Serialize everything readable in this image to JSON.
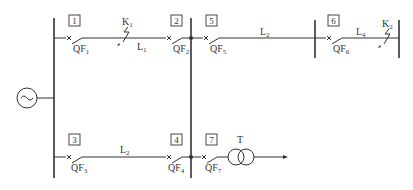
{
  "diagram": {
    "type": "power-system-one-line",
    "colors": {
      "line": "#333333",
      "background": "#ffffff"
    },
    "source": {
      "symbol": "~",
      "name": "generator-source"
    },
    "nodes": [
      {
        "id": "1",
        "breaker": "QF",
        "breaker_sub": "1"
      },
      {
        "id": "2",
        "breaker": "QF",
        "breaker_sub": "2"
      },
      {
        "id": "3",
        "breaker": "QF",
        "breaker_sub": "3"
      },
      {
        "id": "4",
        "breaker": "QF",
        "breaker_sub": "4"
      },
      {
        "id": "5",
        "breaker": "QF",
        "breaker_sub": "5"
      },
      {
        "id": "6",
        "breaker": "QF",
        "breaker_sub": "6"
      },
      {
        "id": "7",
        "breaker": "QF",
        "breaker_sub": "7"
      }
    ],
    "lines": [
      {
        "name": "L",
        "sub": "1",
        "from": "1",
        "to": "2"
      },
      {
        "name": "L",
        "sub": "2",
        "from": "5",
        "to": "6"
      },
      {
        "name": "L",
        "sub": "2",
        "from": "3",
        "to": "4"
      },
      {
        "name": "L",
        "sub": "4",
        "from": "6",
        "to": "end"
      }
    ],
    "faults": [
      {
        "name": "K",
        "sub": "1",
        "location": "L1"
      },
      {
        "name": "K",
        "sub": "2",
        "location": "L4"
      }
    ],
    "transformer": {
      "name": "T"
    }
  }
}
